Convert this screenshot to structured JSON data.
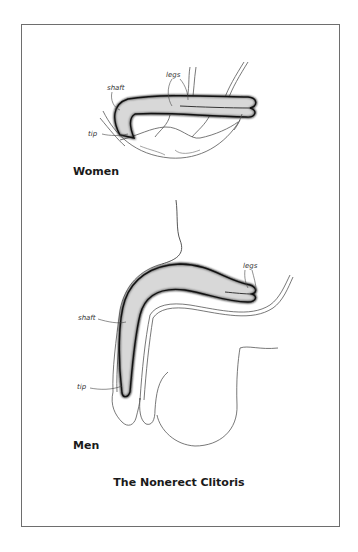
{
  "figure": {
    "title": "The Nonerect Clitoris",
    "panels": [
      {
        "caption": "Women",
        "labels": {
          "shaft": "shaft",
          "legs": "legs",
          "tip": "tip"
        }
      },
      {
        "caption": "Men",
        "labels": {
          "shaft": "shaft",
          "legs": "legs",
          "tip": "tip"
        }
      }
    ]
  },
  "colors": {
    "ink": "#1a1a1a",
    "frame": "#6e6e6e",
    "background": "#ffffff"
  }
}
